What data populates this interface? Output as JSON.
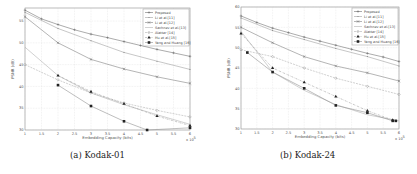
{
  "captions": {
    "a": "(a) Kodak-01",
    "b": "(b) Kodak-24"
  },
  "chart_data": [
    {
      "type": "line",
      "title": "Kodak-01",
      "xlabel": "Embedding Capacity (bits)",
      "ylabel": "PSNR (dB)",
      "x_multiplier": "x 10^5",
      "x": [
        1,
        2,
        3,
        4,
        5,
        6
      ],
      "xticks": [
        "1",
        "1.5",
        "2",
        "2.5",
        "3",
        "3.5",
        "4",
        "4.5",
        "5",
        "5.5",
        "6"
      ],
      "yticks": [
        "30",
        "35",
        "40",
        "45",
        "50",
        "55"
      ],
      "xlim": [
        1,
        6
      ],
      "ylim": [
        30,
        58
      ],
      "grid": true,
      "legend_position": "upper right",
      "series": [
        {
          "name": "Proposed",
          "marker": "plus",
          "style": "solid",
          "x": [
            1,
            1.5,
            2,
            2.5,
            3,
            3.5,
            4,
            4.5,
            5,
            5.5,
            6
          ],
          "values": [
            57.5,
            55.5,
            54.2,
            53.0,
            52.0,
            51.2,
            50.3,
            49.4,
            48.5,
            47.7,
            46.9
          ]
        },
        {
          "name": "Li et al.[11]",
          "marker": "dot",
          "style": "solid",
          "x": [
            1,
            2,
            3,
            4,
            5,
            6
          ],
          "values": [
            57.0,
            53.3,
            50.5,
            47.8,
            45.8,
            43.9
          ]
        },
        {
          "name": "Li et al.[12]",
          "marker": "x",
          "style": "solid",
          "x": [
            1,
            2,
            3,
            4,
            5,
            6
          ],
          "values": [
            56.0,
            50.0,
            46.2,
            44.0,
            42.2,
            40.7
          ]
        },
        {
          "name": "Sachnev et al.[13]",
          "marker": "none",
          "style": "solid",
          "x": [
            1,
            2,
            3,
            4,
            5,
            6
          ],
          "values": [
            49.0,
            42.5,
            38.5,
            35.8,
            33.5,
            31.3
          ]
        },
        {
          "name": "Alattar [14]",
          "marker": "diamond",
          "style": "dashed",
          "x": [
            1,
            2,
            3,
            4,
            5,
            6
          ],
          "values": [
            45.0,
            41.5,
            38.5,
            36.2,
            34.5,
            33.0
          ]
        },
        {
          "name": "Hu et al.[15]",
          "marker": "triangle",
          "style": "dashdot",
          "x": [
            2,
            3,
            4,
            5,
            6
          ],
          "values": [
            42.5,
            38.8,
            36.0,
            33.2,
            31.0
          ]
        },
        {
          "name": "Yang and Huang [16]",
          "marker": "square",
          "style": "solid",
          "x": [
            2,
            3,
            4,
            4.7,
            6
          ],
          "values": [
            40.3,
            35.5,
            32.0,
            30.0,
            30.5
          ]
        }
      ]
    },
    {
      "type": "line",
      "title": "Kodak-24",
      "xlabel": "Embedding Capacity (bits)",
      "ylabel": "PSNR (dB)",
      "x_multiplier": "x 10^5",
      "x": [
        1,
        2,
        3,
        4,
        5,
        6
      ],
      "xticks": [
        "1",
        "1.5",
        "2",
        "2.5",
        "3",
        "3.5",
        "4",
        "4.5",
        "5",
        "5.5",
        "6"
      ],
      "yticks": [
        "30",
        "35",
        "40",
        "45",
        "50",
        "55",
        "60"
      ],
      "xlim": [
        1,
        6
      ],
      "ylim": [
        30,
        60
      ],
      "grid": true,
      "legend_position": "upper right",
      "series": [
        {
          "name": "Proposed",
          "marker": "plus",
          "style": "solid",
          "x": [
            1,
            1.5,
            2,
            2.5,
            3,
            3.5,
            4,
            4.5,
            5,
            5.5,
            6
          ],
          "values": [
            57.8,
            56.2,
            54.8,
            53.7,
            52.6,
            51.6,
            50.6,
            49.6,
            48.6,
            47.7,
            46.6
          ]
        },
        {
          "name": "Li et al.[11]",
          "marker": "dot",
          "style": "solid",
          "x": [
            1,
            2,
            3,
            4,
            5,
            6
          ],
          "values": [
            57.3,
            54.2,
            52.0,
            49.8,
            47.8,
            45.5
          ]
        },
        {
          "name": "Li et al.[12]",
          "marker": "x",
          "style": "solid",
          "x": [
            1,
            2,
            3,
            4,
            5,
            6
          ],
          "values": [
            55.0,
            51.2,
            47.8,
            45.5,
            43.8,
            41.8
          ]
        },
        {
          "name": "Sachnev et al.[13]",
          "marker": "none",
          "style": "solid",
          "x": [
            1,
            2,
            3,
            4,
            5,
            6
          ],
          "values": [
            54.0,
            44.0,
            39.5,
            36.0,
            33.5,
            32.0
          ]
        },
        {
          "name": "Alattar [14]",
          "marker": "diamond",
          "style": "dashed",
          "x": [
            1,
            2,
            3,
            4,
            5,
            6
          ],
          "values": [
            49.5,
            47.8,
            45.0,
            42.5,
            40.5,
            38.5
          ]
        },
        {
          "name": "Hu et al.[15]",
          "marker": "triangle",
          "style": "dashdot",
          "x": [
            1,
            2,
            3,
            4,
            5,
            5.8
          ],
          "values": [
            53.5,
            45.0,
            41.5,
            38.0,
            34.5,
            32.2
          ]
        },
        {
          "name": "Yang and Huang [16]",
          "marker": "square",
          "style": "solid",
          "x": [
            1.2,
            2,
            3,
            4,
            5,
            5.8,
            5.9
          ],
          "values": [
            48.8,
            44.0,
            40.0,
            35.8,
            34.0,
            32.0,
            32.0
          ]
        }
      ]
    }
  ]
}
